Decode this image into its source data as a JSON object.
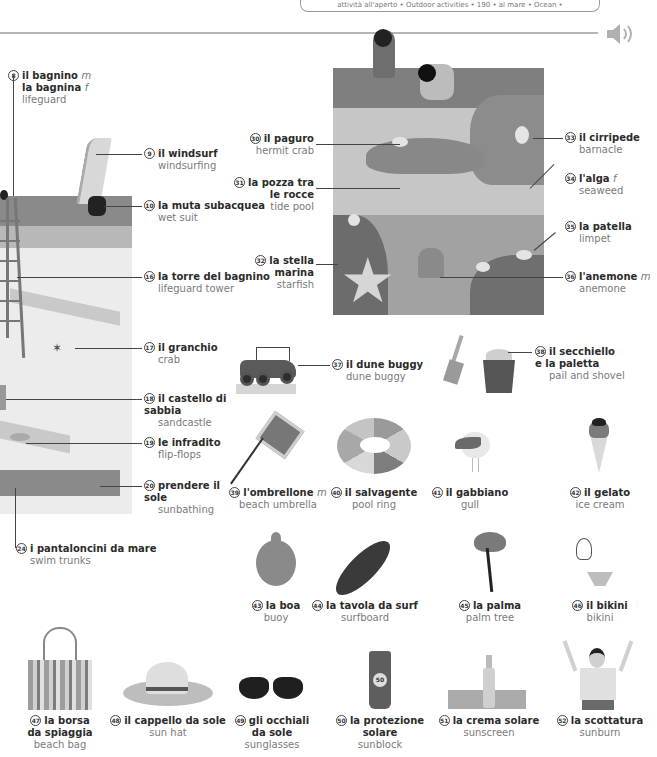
{
  "header": {
    "tab_text": "attività all'aperto • Outdoor activities • 190 • al mare • Ocean •",
    "audio_icon": "speaker-icon"
  },
  "scene_beach": {
    "labels": [
      {
        "num": "8",
        "it": "il bagnino",
        "gender": "m",
        "it2": "la bagnina",
        "gender2": "f",
        "en": "lifeguard"
      },
      {
        "num": "9",
        "it": "il windsurf",
        "en": "windsurfing"
      },
      {
        "num": "10",
        "it": "la muta subacquea",
        "en": "wet suit"
      },
      {
        "num": "16",
        "it": "la torre del bagnino",
        "en": "lifeguard tower"
      },
      {
        "num": "17",
        "it": "il granchio",
        "en": "crab"
      },
      {
        "num": "18",
        "it": "il castello di sabbia",
        "en": "sandcastle"
      },
      {
        "num": "19",
        "it": "le infradito",
        "en": "flip-flops"
      },
      {
        "num": "20",
        "it": "prendere il sole",
        "en": "sunbathing"
      },
      {
        "num": "24",
        "it": "i pantaloncini da mare",
        "en": "swim trunks"
      }
    ]
  },
  "scene_tidepool": {
    "labels": [
      {
        "num": "30",
        "it": "il paguro",
        "en": "hermit crab"
      },
      {
        "num": "31",
        "it": "la pozza tra le rocce",
        "en": "tide pool"
      },
      {
        "num": "32",
        "it": "la stella marina",
        "en": "starfish"
      },
      {
        "num": "33",
        "it": "il cirripede",
        "en": "barnacle"
      },
      {
        "num": "34",
        "it": "l'alga",
        "gender": "f",
        "en": "seaweed"
      },
      {
        "num": "35",
        "it": "la patella",
        "en": "limpet"
      },
      {
        "num": "36",
        "it": "l'anemone",
        "gender": "m",
        "en": "anemone"
      }
    ]
  },
  "items": [
    {
      "num": "37",
      "it": "il dune buggy",
      "en": "dune buggy"
    },
    {
      "num": "38",
      "it": "il secchiello e la paletta",
      "en": "pail and shovel"
    },
    {
      "num": "39",
      "it": "l'ombrellone",
      "gender": "m",
      "en": "beach umbrella"
    },
    {
      "num": "40",
      "it": "il salvagente",
      "en": "pool ring"
    },
    {
      "num": "41",
      "it": "il gabbiano",
      "en": "gull"
    },
    {
      "num": "42",
      "it": "il gelato",
      "en": "ice cream"
    },
    {
      "num": "43",
      "it": "la boa",
      "en": "buoy"
    },
    {
      "num": "44",
      "it": "la tavola da surf",
      "en": "surfboard"
    },
    {
      "num": "45",
      "it": "la palma",
      "en": "palm tree"
    },
    {
      "num": "46",
      "it": "il bikini",
      "en": "bikini"
    },
    {
      "num": "47",
      "it": "la borsa da spiaggia",
      "en": "beach bag"
    },
    {
      "num": "48",
      "it": "il cappello da sole",
      "en": "sun hat"
    },
    {
      "num": "49",
      "it": "gli occhiali da sole",
      "en": "sunglasses"
    },
    {
      "num": "50",
      "it": "la protezione solare",
      "en": "sunblock"
    },
    {
      "num": "51",
      "it": "la crema solare",
      "en": "sunscreen"
    },
    {
      "num": "52",
      "it": "la scottatura",
      "en": "sunburn"
    }
  ],
  "sunblock_badge": "50"
}
